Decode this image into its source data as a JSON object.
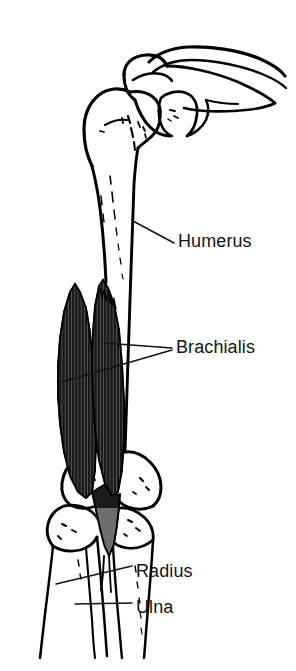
{
  "figure": {
    "background_color": "#ffffff",
    "ink_color": "#000000",
    "text_color": "#141414",
    "muscle_fill_color": "#1b1b1b",
    "muscle_tendon_fill_color": "#6e6e6e"
  },
  "labels": [
    {
      "id": "humerus",
      "text": "Humerus",
      "target_structure": "humerus-shaft"
    },
    {
      "id": "brachialis",
      "text": "Brachialis",
      "target_structure": "brachialis-muscle"
    },
    {
      "id": "radius",
      "text": "Radius",
      "target_structure": "radius-shaft"
    },
    {
      "id": "ulna",
      "text": "Ulna",
      "target_structure": "ulna-shaft"
    }
  ],
  "structures": [
    {
      "id": "clavicle",
      "name": "Clavicle"
    },
    {
      "id": "scapula",
      "name": "Scapula"
    },
    {
      "id": "acromion",
      "name": "Acromion process"
    },
    {
      "id": "coracoid",
      "name": "Coracoid process"
    },
    {
      "id": "humerus-head",
      "name": "Head of humerus"
    },
    {
      "id": "humerus-shaft",
      "name": "Shaft of humerus"
    },
    {
      "id": "lateral-epicondyle",
      "name": "Lateral epicondyle"
    },
    {
      "id": "medial-epicondyle",
      "name": "Medial epicondyle"
    },
    {
      "id": "brachialis-muscle",
      "name": "Brachialis"
    },
    {
      "id": "radius-shaft",
      "name": "Radius"
    },
    {
      "id": "ulna-shaft",
      "name": "Ulna"
    }
  ]
}
